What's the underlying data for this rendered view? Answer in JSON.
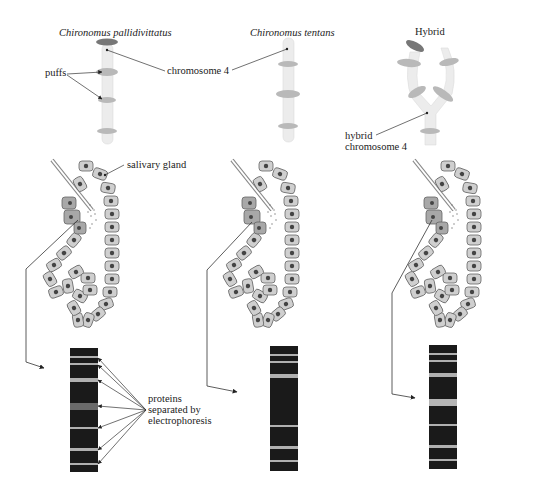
{
  "columns": [
    {
      "title": "Chironomus pallidivittatus",
      "italic": true
    },
    {
      "title": "Chironomus tentans",
      "italic": true
    },
    {
      "title": "Hybrid",
      "italic": false
    }
  ],
  "labels": {
    "puffs": "puffs",
    "chromosome4": "chromosome 4",
    "hybrid_chromosome_line1": "hybrid",
    "hybrid_chromosome_line2": "chromosome 4",
    "salivary_gland": "salivary gland",
    "proteins_line1": "proteins",
    "proteins_line2": "separated by",
    "proteins_line3": "electrophoresis"
  },
  "colors": {
    "chromosome": "#ececec",
    "puff": "#b9b9b9",
    "dark_puff": "#777777",
    "cell": "#cfcfcf",
    "cell_border": "#666666",
    "nucleus": "#444444",
    "special_cells": "#a8a8a8",
    "gel": "#1a1a1a",
    "band": "#b0b0b0"
  },
  "gels": [
    {
      "name": "pallidivittatus",
      "bands": [
        {
          "y": 8,
          "h": 2
        },
        {
          "y": 15,
          "h": 2
        },
        {
          "y": 30,
          "h": 4
        },
        {
          "y": 55,
          "h": 7
        },
        {
          "y": 79,
          "h": 2
        },
        {
          "y": 100,
          "h": 3
        },
        {
          "y": 115,
          "h": 2
        }
      ]
    },
    {
      "name": "tentans",
      "bands": [
        {
          "y": 8,
          "h": 2
        },
        {
          "y": 15,
          "h": 2
        },
        {
          "y": 28,
          "h": 4
        },
        {
          "y": 79,
          "h": 2
        },
        {
          "y": 100,
          "h": 3
        },
        {
          "y": 114,
          "h": 2
        }
      ]
    },
    {
      "name": "hybrid",
      "bands": [
        {
          "y": 8,
          "h": 2
        },
        {
          "y": 15,
          "h": 2
        },
        {
          "y": 28,
          "h": 4
        },
        {
          "y": 54,
          "h": 7
        },
        {
          "y": 79,
          "h": 2
        },
        {
          "y": 100,
          "h": 3
        },
        {
          "y": 114,
          "h": 2
        }
      ]
    }
  ]
}
